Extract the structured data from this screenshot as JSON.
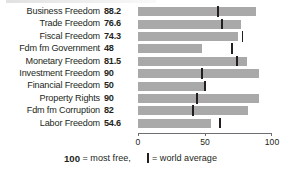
{
  "chart_data": {
    "type": "bar",
    "orientation": "horizontal",
    "title": "",
    "xlabel": "",
    "ylabel": "",
    "xlim": [
      0,
      100
    ],
    "xticks": [
      0,
      50,
      100
    ],
    "xtick_labels": [
      "0",
      "50",
      "100"
    ],
    "grid": false,
    "legend_position": "bottom",
    "bar_color": "#a9a9a9",
    "marker_color": "#231f20",
    "categories": [
      "Business Freedom",
      "Trade Freedom",
      "Fiscal Freedom",
      "Fdm fm Government",
      "Monetary Freedom",
      "Investment Freedom",
      "Financial Freedom",
      "Property Rights",
      "Fdm fm Corruption",
      "Labor Freedom"
    ],
    "values": [
      88.2,
      76.6,
      74.3,
      48,
      81.5,
      90,
      50,
      90,
      82,
      54.6
    ],
    "value_labels": [
      "88.2",
      "76.6",
      "74.3",
      "48",
      "81.5",
      "90",
      "50",
      "90",
      "82",
      "54.6"
    ],
    "series": [
      {
        "name": "Score",
        "values": [
          88.2,
          76.6,
          74.3,
          48,
          81.5,
          90,
          50,
          90,
          82,
          54.6
        ]
      },
      {
        "name": "World average",
        "values": [
          60,
          63,
          78,
          70,
          74,
          48,
          50,
          44,
          41,
          61
        ]
      }
    ],
    "annotations": [
      "100 = most free",
      "| = world average"
    ]
  },
  "rows": [
    {
      "label": "Business Freedom",
      "value": "88.2",
      "bar": 88.2,
      "avg": 60
    },
    {
      "label": "Trade Freedom",
      "value": "76.6",
      "bar": 76.6,
      "avg": 63
    },
    {
      "label": "Fiscal Freedom",
      "value": "74.3",
      "bar": 74.3,
      "avg": 78
    },
    {
      "label": "Fdm fm Government",
      "value": "48",
      "bar": 48,
      "avg": 70
    },
    {
      "label": "Monetary Freedom",
      "value": "81.5",
      "bar": 81.5,
      "avg": 74
    },
    {
      "label": "Investment Freedom",
      "value": "90",
      "bar": 90,
      "avg": 48
    },
    {
      "label": "Financial Freedom",
      "value": "50",
      "bar": 50,
      "avg": 50
    },
    {
      "label": "Property Rights",
      "value": "90",
      "bar": 90,
      "avg": 44
    },
    {
      "label": "Fdm fm Corruption",
      "value": "82",
      "bar": 82,
      "avg": 41
    },
    {
      "label": "Labor Freedom",
      "value": "54.6",
      "bar": 54.6,
      "avg": 61
    }
  ],
  "axis": {
    "ticks": [
      {
        "value": 0,
        "label": "0"
      },
      {
        "value": 50,
        "label": "50"
      },
      {
        "value": 100,
        "label": "100"
      }
    ]
  },
  "legend": {
    "most_free_number": "100",
    "most_free_text": "= most free,",
    "world_average_text": "= world average"
  }
}
